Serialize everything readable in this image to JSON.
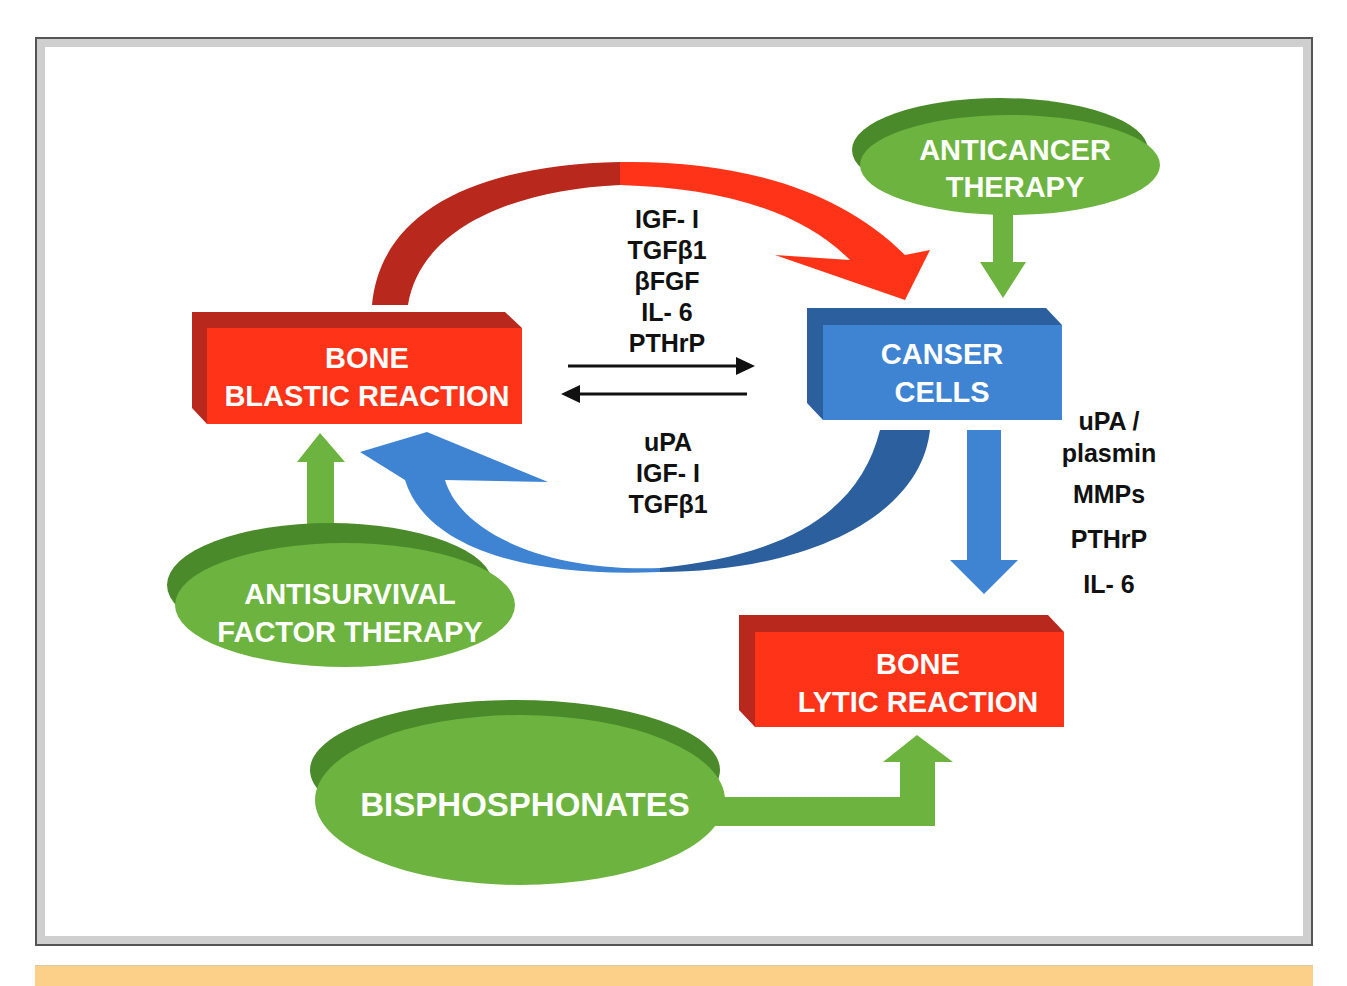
{
  "colors": {
    "red": "#ff3318",
    "red_dark": "#b8281c",
    "blue": "#3f84d2",
    "blue_dark": "#2c5f9e",
    "green": "#6db33f",
    "green_dark": "#4a8a2a",
    "caption_band": "#fdd089"
  },
  "nodes": {
    "bone_blastic": {
      "line1": "BONE",
      "line2": "BLASTIC REACTION"
    },
    "cancer_cells": {
      "line1": "CANSER",
      "line2": "CELLS"
    },
    "bone_lytic": {
      "line1": "BONE",
      "line2": "LYTIC REACTION"
    },
    "anticancer": {
      "line1": "ANTICANCER",
      "line2": "THERAPY"
    },
    "antisurvival": {
      "line1": "ANTISURVIVAL",
      "line2": "FACTOR THERAPY"
    },
    "bisphosphonates": {
      "line1": "BISPHOSPHONATES"
    }
  },
  "factors": {
    "bone_to_cancer": [
      "IGF- I",
      "TGFβ1",
      "βFGF",
      "IL- 6",
      "PTHrP"
    ],
    "cancer_to_bone": [
      "uPA",
      "IGF- I",
      "TGFβ1"
    ],
    "cancer_to_lytic": [
      "uPA /",
      "plasmin",
      "MMPs",
      "PTHrP",
      "IL- 6"
    ]
  },
  "edges": [
    {
      "from": "bone_blastic",
      "to": "cancer_cells",
      "style": "curved-red"
    },
    {
      "from": "cancer_cells",
      "to": "bone_blastic",
      "style": "curved-blue"
    },
    {
      "from": "bone_blastic",
      "to": "cancer_cells",
      "style": "thin-black"
    },
    {
      "from": "cancer_cells",
      "to": "bone_blastic",
      "style": "thin-black"
    },
    {
      "from": "cancer_cells",
      "to": "bone_lytic",
      "style": "straight-blue"
    },
    {
      "from": "anticancer",
      "to": "cancer_cells",
      "style": "straight-green"
    },
    {
      "from": "antisurvival",
      "to": "bone_blastic",
      "style": "straight-green"
    },
    {
      "from": "bisphosphonates",
      "to": "bone_lytic",
      "style": "elbow-green"
    }
  ]
}
